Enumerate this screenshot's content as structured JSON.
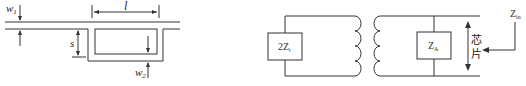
{
  "left_diagram": {
    "title": "T-match microstrip geometry",
    "labels": {
      "w1": "w",
      "w1_sub": "1",
      "w2": "w",
      "w2_sub": "2",
      "length": "l",
      "spacing": "s"
    }
  },
  "right_diagram": {
    "title": "Equivalent circuit",
    "left_box": {
      "label": "2Z",
      "sub": "t"
    },
    "right_box": {
      "label": "Z",
      "sub": "A"
    },
    "chip_label_1": "芯",
    "chip_label_2": "片",
    "input": {
      "label": "Z",
      "sub": "in"
    }
  },
  "colors": {
    "line": "#333333",
    "background": "#ffffff"
  }
}
